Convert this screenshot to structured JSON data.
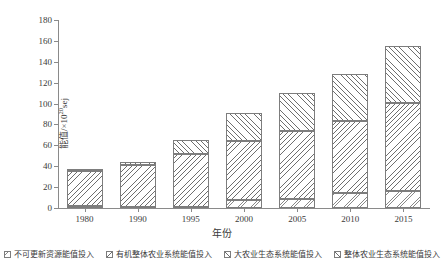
{
  "chart_data": {
    "type": "bar",
    "title": "",
    "subtitle": "",
    "xlabel": "年份",
    "ylabel": "能值/×10²⁰sej",
    "ylabel_base": "能值/×10",
    "ylabel_exp": "20",
    "ylabel_unit": "sej",
    "categories": [
      "1980",
      "1990",
      "1995",
      "2000",
      "2005",
      "2010",
      "2015"
    ],
    "ylim": [
      0,
      180
    ],
    "yticks": [
      0,
      20,
      40,
      60,
      80,
      100,
      120,
      140,
      160,
      180
    ],
    "ytick_labels": [
      "0",
      "20",
      "40",
      "60",
      "80",
      "100",
      "120",
      "140",
      "160",
      "180"
    ],
    "grid": false,
    "stacked": true,
    "legend_position": "bottom",
    "series": [
      {
        "name": "不可更新资源能值投入",
        "fill": "cross-dense",
        "values": [
          1.5,
          1.0,
          1.0,
          7.5,
          9.0,
          14.0,
          16.0
        ]
      },
      {
        "name": "有机整体农业系统能值投入",
        "fill": "diagonal-back",
        "values": [
          33.5,
          40.0,
          51.0,
          56.5,
          64.5,
          69.0,
          85.0
        ]
      },
      {
        "name": "大农业生态系统能值投入",
        "fill": "diagonal-forward",
        "values": [
          1.5,
          3.0,
          13.0,
          27.0,
          36.5,
          45.0,
          54.0
        ]
      }
    ],
    "totals": [
      36.5,
      44.0,
      65.0,
      91.0,
      110.0,
      128.0,
      155.0
    ],
    "annotations": []
  },
  "legend": {
    "items": [
      {
        "label": "不可更新资源能值投入",
        "fill": "cross-dense"
      },
      {
        "label": "有机整体农业系统能值投入",
        "fill": "diagonal-back"
      },
      {
        "label": "大农业生态系统能值投入",
        "fill": "diagonal-forward"
      },
      {
        "label": "整体农业生态系统能值投入",
        "fill": "diagonal-forward"
      }
    ]
  },
  "colors": {
    "axis": "#8a8a8a",
    "hatch": "#6e6e6e",
    "outline": "#7d7d7d",
    "text": "#3a3a3a",
    "background": "#ffffff"
  }
}
